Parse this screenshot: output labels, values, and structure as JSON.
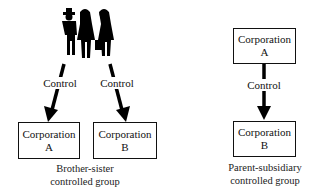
{
  "brother_sister": {
    "owners_icon": "people-silhouette-icon",
    "control_labels": [
      "Control",
      "Control"
    ],
    "corporation_a": {
      "line1": "Corporation",
      "line2": "A"
    },
    "corporation_b": {
      "line1": "Corporation",
      "line2": "B"
    },
    "caption": {
      "line1": "Brother-sister",
      "line2": "controlled group"
    }
  },
  "parent_subsidiary": {
    "corporation_a": {
      "line1": "Corporation",
      "line2": "A"
    },
    "control_label": "Control",
    "corporation_b": {
      "line1": "Corporation",
      "line2": "B"
    },
    "caption": {
      "line1": "Parent-subsidiary",
      "line2": "controlled group"
    }
  }
}
